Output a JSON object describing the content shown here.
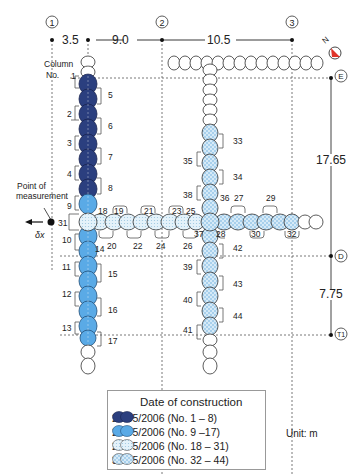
{
  "grid_axes": {
    "columns": [
      {
        "id": "1",
        "label": "1"
      },
      {
        "id": "2",
        "label": "2"
      },
      {
        "id": "3",
        "label": "3"
      }
    ],
    "rows": [
      {
        "id": "E",
        "label": "E"
      },
      {
        "id": "D",
        "label": "D"
      },
      {
        "id": "T1",
        "label": "T1"
      }
    ]
  },
  "dimensions": {
    "top": [
      "3.5",
      "9.0",
      "10.5"
    ],
    "right": [
      "17.65",
      "7.75"
    ],
    "unit_label": "Unit: m"
  },
  "annotations": {
    "column_no_line1": "Column",
    "column_no_line2": "No.",
    "point_of_measurement_line1": "Point of",
    "point_of_measurement_line2": "measurement",
    "delta_x": "δx",
    "north": "N"
  },
  "column_numbers": {
    "wall_1_left": [
      "1",
      "2",
      "3",
      "4",
      "9",
      "31",
      "10",
      "11",
      "12",
      "13"
    ],
    "wall_1_right": [
      "5",
      "6",
      "7",
      "8",
      "14",
      "15",
      "16",
      "17"
    ],
    "wall_h_top": [
      "18",
      "19",
      "21",
      "23",
      "25",
      "36",
      "27",
      "29"
    ],
    "wall_h_bottom": [
      "20",
      "22",
      "24",
      "26",
      "37",
      "28",
      "30",
      "32"
    ],
    "wall_2_left": [
      "35",
      "38",
      "39",
      "40",
      "41"
    ],
    "wall_2_right": [
      "33",
      "34",
      "42",
      "43",
      "44"
    ]
  },
  "legend": {
    "title": "Date of construction",
    "items": [
      {
        "label": "26/05/2006 (No. 1 – 8)",
        "color": "#2b3f7f",
        "pattern": "solid-dark"
      },
      {
        "label": "27/05/2006 (No. 9 –17)",
        "color": "#5aaae6",
        "pattern": "solid-light"
      },
      {
        "label": "29/05/2006 (No. 18 – 31)",
        "color": "#d8ecf6",
        "pattern": "dotted"
      },
      {
        "label": "30/05/2006 (No. 32 – 44)",
        "color": "#bcdcf0",
        "pattern": "checkered"
      }
    ]
  },
  "colors": {
    "dark_blue": "#2b3f7f",
    "light_blue": "#5aaae6",
    "pale_dotted": "#d8ecf6",
    "pale_checker": "#c4e0f2",
    "north_arrow": "#e0352b"
  }
}
